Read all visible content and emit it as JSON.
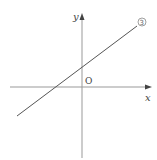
{
  "diagram": {
    "type": "coordinate-plane",
    "x_axis_label": "x",
    "y_axis_label": "y",
    "origin_label": "O",
    "line": {
      "label": "③",
      "from_px": [
        17,
        116
      ],
      "to_px": [
        137,
        26
      ],
      "color": "#555555"
    },
    "axis_color": "#888888"
  }
}
